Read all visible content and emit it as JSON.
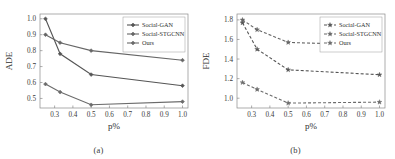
{
  "figure": {
    "panels": [
      {
        "caption": "(a)",
        "chart_data": {
          "type": "line",
          "title": "",
          "xlabel": "p%",
          "ylabel": "ADE",
          "x": [
            0.25,
            0.33,
            0.5,
            1.0
          ],
          "xticks": [
            0.3,
            0.4,
            0.5,
            0.6,
            0.7,
            0.8,
            0.9,
            1.0
          ],
          "xticklabels": [
            "0.3",
            "0.4",
            "0.5",
            "0.6",
            "0.7",
            "0.8",
            "0.9",
            "1.0"
          ],
          "yticks": [
            0.5,
            0.6,
            0.7,
            0.8,
            0.9,
            1.0
          ],
          "yticklabels": [
            "0.5",
            "0.6",
            "0.7",
            "0.8",
            "0.9",
            "1.0"
          ],
          "xlim": [
            0.22,
            1.03
          ],
          "ylim": [
            0.44,
            1.03
          ],
          "grid": false,
          "linestyle": "solid",
          "legend_position": "upper right",
          "series": [
            {
              "name": "Social-GAN",
              "values": [
                1.0,
                0.78,
                0.65,
                0.58
              ],
              "color": "#555555",
              "marker": "diamond"
            },
            {
              "name": "Social-STGCNN",
              "values": [
                0.9,
                0.85,
                0.8,
                0.74
              ],
              "color": "#666666",
              "marker": "diamond"
            },
            {
              "name": "Ours",
              "values": [
                0.59,
                0.54,
                0.46,
                0.48
              ],
              "color": "#6b6b6b",
              "marker": "diamond"
            }
          ]
        }
      },
      {
        "caption": "(b)",
        "chart_data": {
          "type": "line",
          "title": "",
          "xlabel": "p%",
          "ylabel": "FDE",
          "x": [
            0.25,
            0.33,
            0.5,
            1.0
          ],
          "xticks": [
            0.3,
            0.4,
            0.5,
            0.6,
            0.7,
            0.8,
            0.9,
            1.0
          ],
          "xticklabels": [
            "0.3",
            "0.4",
            "0.5",
            "0.6",
            "0.7",
            "0.8",
            "0.9",
            "1.0"
          ],
          "yticks": [
            1.0,
            1.2,
            1.4,
            1.6,
            1.8
          ],
          "yticklabels": [
            "1.0",
            "1.2",
            "1.4",
            "1.6",
            "1.8"
          ],
          "xlim": [
            0.22,
            1.03
          ],
          "ylim": [
            0.9,
            1.86
          ],
          "grid": false,
          "linestyle": "dashed",
          "legend_position": "upper right",
          "series": [
            {
              "name": "Social-GAN",
              "values": [
                1.77,
                1.5,
                1.29,
                1.24
              ],
              "color": "#555555",
              "marker": "star"
            },
            {
              "name": "Social-STGCNN",
              "values": [
                1.8,
                1.7,
                1.57,
                1.54
              ],
              "color": "#666666",
              "marker": "star"
            },
            {
              "name": "Ours",
              "values": [
                1.16,
                1.09,
                0.95,
                0.96
              ],
              "color": "#6b6b6b",
              "marker": "star"
            }
          ]
        }
      }
    ]
  }
}
